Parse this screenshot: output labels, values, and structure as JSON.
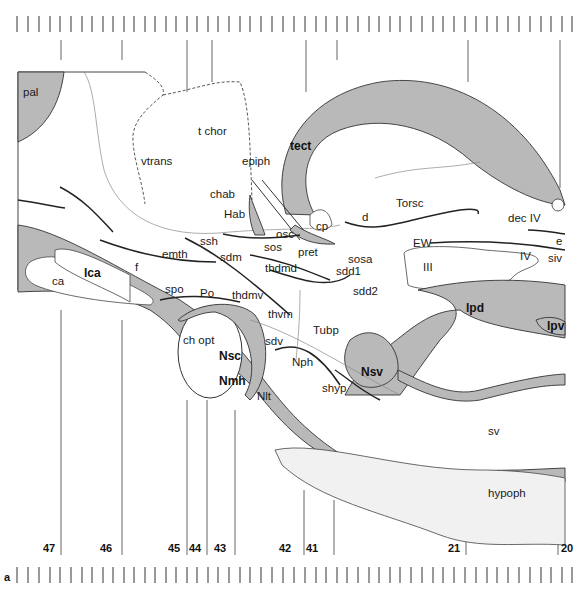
{
  "figure": {
    "panel_letter": "a",
    "section_numbers": [
      {
        "label": "47",
        "x": 61
      },
      {
        "label": "46",
        "x": 118
      },
      {
        "label": "45",
        "x": 186
      },
      {
        "label": "44",
        "x": 207
      },
      {
        "label": "43",
        "x": 235
      },
      {
        "label": "42",
        "x": 302
      },
      {
        "label": "41",
        "x": 332
      },
      {
        "label": "21",
        "x": 465
      },
      {
        "label": "20",
        "x": 557
      }
    ]
  },
  "labels": {
    "pal": "pal",
    "vtrans": "vtrans",
    "t_chor": "t chor",
    "epiph": "epiph",
    "tect": "tect",
    "chab": "chab",
    "Hab": "Hab",
    "cp": "cp",
    "d": "d",
    "Torsc": "Torsc",
    "dec_IV": "dec IV",
    "e": "e",
    "siv": "siv",
    "EW": "EW",
    "IV": "IV",
    "III": "III",
    "ssh": "ssh",
    "osc": "osc",
    "sos": "sos",
    "pret": "pret",
    "sosa": "sosa",
    "emth": "emth",
    "sdm": "sdm",
    "thdmd": "thdmd",
    "sdd1": "sdd1",
    "sdd2": "sdd2",
    "f": "f",
    "ca": "ca",
    "lca": "lca",
    "spo": "spo",
    "Po": "Po",
    "thdmv": "thdmv",
    "thvm": "thvm",
    "Tubp": "Tubp",
    "lpd": "lpd",
    "lpv": "lpv",
    "ch_opt": "ch opt",
    "Nsc": "Nsc",
    "Nmh": "Nmh",
    "sdv": "sdv",
    "Nph": "Nph",
    "Nlt": "Nlt",
    "shyp": "shyp",
    "Nsv": "Nsv",
    "sv": "sv",
    "hypoph": "hypoph"
  }
}
